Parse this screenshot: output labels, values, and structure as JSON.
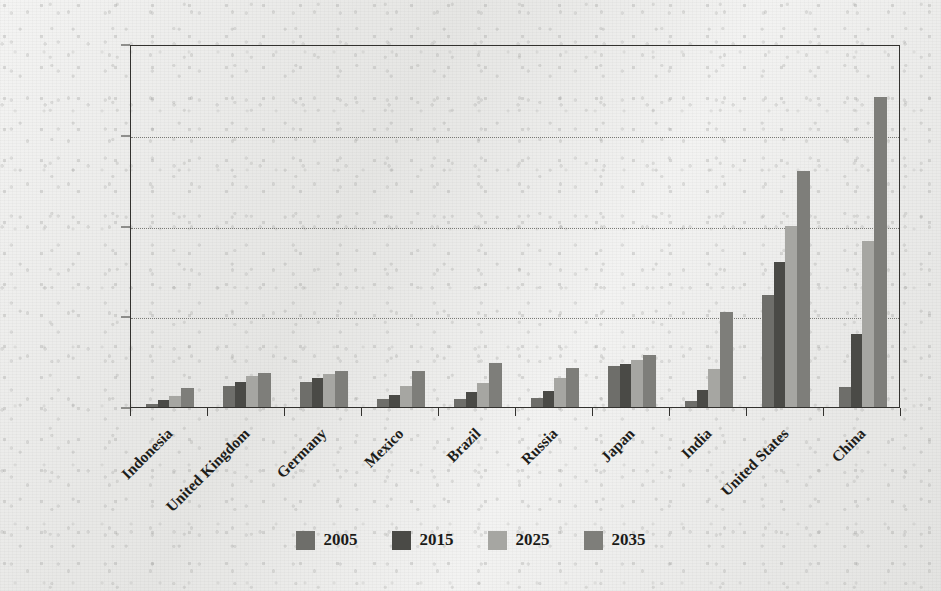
{
  "chart_data": {
    "type": "bar",
    "title": "",
    "subtitle": "",
    "xlabel": "",
    "ylabel": "",
    "grid": true,
    "legend_position": "bottom",
    "ylim": [
      0,
      40000
    ],
    "y_ticks": [
      0,
      10000,
      20000,
      30000,
      40000
    ],
    "y_tick_labels": [
      "$0.00",
      "$10,000.00",
      "$20,000.00",
      "$30,000.00",
      "$40,000.00"
    ],
    "categories": [
      "Indonesia",
      "United Kingdom",
      "Germany",
      "Mexico",
      "Brazil",
      "Russia",
      "Japan",
      "India",
      "United States",
      "China"
    ],
    "series": [
      {
        "name": "2005",
        "color": "#6e6e6a",
        "values": [
          280,
          2300,
          2800,
          850,
          900,
          1000,
          4500,
          700,
          12300,
          2200
        ]
      },
      {
        "name": "2015",
        "color": "#4a4a46",
        "values": [
          750,
          2800,
          3200,
          1350,
          1600,
          1750,
          4700,
          1900,
          16000,
          8000
        ]
      },
      {
        "name": "2025",
        "color": "#a6a6a2",
        "values": [
          1250,
          3400,
          3600,
          2300,
          2600,
          3200,
          5200,
          4200,
          20000,
          18300
        ]
      },
      {
        "name": "2035",
        "color": "#7e7e7a",
        "values": [
          2150,
          3800,
          4000,
          4000,
          4900,
          4300,
          5700,
          10500,
          26000,
          34200
        ]
      }
    ]
  },
  "legend": {
    "items": [
      {
        "label": "2005"
      },
      {
        "label": "2015"
      },
      {
        "label": "2025"
      },
      {
        "label": "2035"
      }
    ]
  }
}
